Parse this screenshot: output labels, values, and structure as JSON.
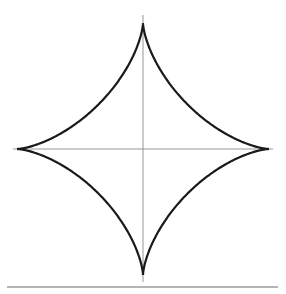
{
  "diagram": {
    "title": "",
    "shape": "astroid",
    "equation": "x^(2/3) + y^(2/3) = a^(2/3)",
    "cusps": 4,
    "center": [
      143,
      149
    ],
    "radius": 126,
    "curve_color": "#1a1a1a",
    "curve_width": 2.2,
    "axis_color": "#8a8a8a",
    "axis_width": 0.9,
    "axes": {
      "horizontal": {
        "x1": 13,
        "x2": 273,
        "y": 149
      },
      "vertical": {
        "x": 143,
        "y1": 15,
        "y2": 282
      }
    },
    "baseline_rule": {
      "x1": 7,
      "x2": 278,
      "y": 287,
      "color": "#b5b5b5",
      "width": 2.2
    }
  }
}
